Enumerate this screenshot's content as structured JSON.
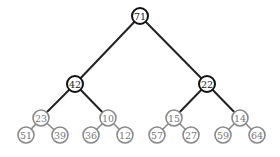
{
  "tree": {
    "nodes": [
      {
        "id": "n0",
        "value": "71",
        "x": 140,
        "y": 16,
        "style": "dark"
      },
      {
        "id": "n1",
        "value": "42",
        "x": 75,
        "y": 84,
        "style": "dark"
      },
      {
        "id": "n2",
        "value": "22",
        "x": 207,
        "y": 84,
        "style": "dark"
      },
      {
        "id": "n3",
        "value": "23",
        "x": 41,
        "y": 118,
        "style": "gray"
      },
      {
        "id": "n4",
        "value": "10",
        "x": 108,
        "y": 118,
        "style": "gray"
      },
      {
        "id": "n5",
        "value": "15",
        "x": 174,
        "y": 118,
        "style": "gray"
      },
      {
        "id": "n6",
        "value": "14",
        "x": 240,
        "y": 118,
        "style": "gray"
      },
      {
        "id": "n7",
        "value": "51",
        "x": 26,
        "y": 135,
        "style": "gray"
      },
      {
        "id": "n8",
        "value": "39",
        "x": 60,
        "y": 135,
        "style": "gray"
      },
      {
        "id": "n9",
        "value": "36",
        "x": 91,
        "y": 135,
        "style": "gray"
      },
      {
        "id": "n10",
        "value": "12",
        "x": 125,
        "y": 135,
        "style": "gray"
      },
      {
        "id": "n11",
        "value": "57",
        "x": 157,
        "y": 135,
        "style": "gray"
      },
      {
        "id": "n12",
        "value": "27",
        "x": 191,
        "y": 135,
        "style": "gray"
      },
      {
        "id": "n13",
        "value": "59",
        "x": 223,
        "y": 135,
        "style": "gray"
      },
      {
        "id": "n14",
        "value": "64",
        "x": 257,
        "y": 135,
        "style": "gray"
      }
    ],
    "edges": [
      [
        "n0",
        "n1",
        "dark"
      ],
      [
        "n0",
        "n2",
        "dark"
      ],
      [
        "n1",
        "n3",
        "dark"
      ],
      [
        "n1",
        "n4",
        "dark"
      ],
      [
        "n2",
        "n5",
        "dark"
      ],
      [
        "n2",
        "n6",
        "dark"
      ],
      [
        "n3",
        "n7",
        "gray"
      ],
      [
        "n3",
        "n8",
        "gray"
      ],
      [
        "n4",
        "n9",
        "gray"
      ],
      [
        "n4",
        "n10",
        "gray"
      ],
      [
        "n5",
        "n11",
        "gray"
      ],
      [
        "n5",
        "n12",
        "gray"
      ],
      [
        "n6",
        "n13",
        "gray"
      ],
      [
        "n6",
        "n14",
        "gray"
      ]
    ],
    "radius": 8
  }
}
